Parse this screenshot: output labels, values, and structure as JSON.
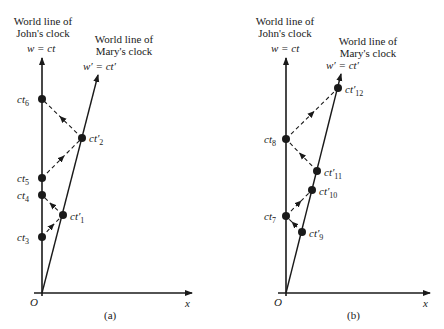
{
  "panels": [
    {
      "id": "a",
      "caption": "(a)",
      "john_title_1": "World line of",
      "john_title_2": "John's clock",
      "john_eq": "w = ct",
      "mary_title_1": "World line of",
      "mary_title_2": "Mary's clock",
      "mary_eq": "w′ = ct′",
      "origin": "O",
      "x_axis": "x",
      "points": [
        {
          "base": "ct",
          "sub": "6"
        },
        {
          "base": "ct′",
          "sub": "2"
        },
        {
          "base": "ct",
          "sub": "5"
        },
        {
          "base": "ct",
          "sub": "4"
        },
        {
          "base": "ct′",
          "sub": "1"
        },
        {
          "base": "ct",
          "sub": "3"
        }
      ]
    },
    {
      "id": "b",
      "caption": "(b)",
      "john_title_1": "World line of",
      "john_title_2": "John's clock",
      "john_eq": "w = ct",
      "mary_title_1": "World line of",
      "mary_title_2": "Mary's clock",
      "mary_eq": "w′ = ct′",
      "origin": "O",
      "x_axis": "x",
      "points": [
        {
          "base": "ct′",
          "sub": "12"
        },
        {
          "base": "ct",
          "sub": "8"
        },
        {
          "base": "ct′",
          "sub": "11"
        },
        {
          "base": "ct′",
          "sub": "10"
        },
        {
          "base": "ct",
          "sub": "7"
        },
        {
          "base": "ct′",
          "sub": "9"
        }
      ]
    }
  ]
}
